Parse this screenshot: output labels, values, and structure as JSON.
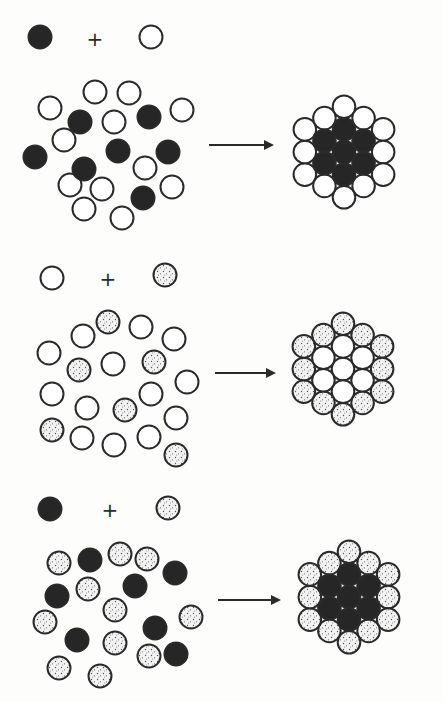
{
  "figure": {
    "colors": {
      "dark_cell": "#262626",
      "light_cell": "#ffffff",
      "dotted_cell": "#f2f2f2",
      "outline": "#2a2a2a",
      "dot": "#555555"
    },
    "cell_radius": 11.5,
    "plus_symbol": "+",
    "panels": [
      {
        "id": "A",
        "legend": {
          "left": {
            "type": "dark",
            "x": 40,
            "y": 37
          },
          "plus": {
            "x": 95,
            "y": 40
          },
          "right": {
            "type": "light",
            "x": 151,
            "y": 37
          }
        },
        "scattered": [
          {
            "type": "light",
            "x": 95,
            "y": 92
          },
          {
            "type": "light",
            "x": 129,
            "y": 93
          },
          {
            "type": "light",
            "x": 50,
            "y": 108
          },
          {
            "type": "light",
            "x": 182,
            "y": 110
          },
          {
            "type": "light",
            "x": 114,
            "y": 122
          },
          {
            "type": "light",
            "x": 64,
            "y": 140
          },
          {
            "type": "light",
            "x": 145,
            "y": 168
          },
          {
            "type": "light",
            "x": 70,
            "y": 185
          },
          {
            "type": "light",
            "x": 102,
            "y": 189
          },
          {
            "type": "light",
            "x": 172,
            "y": 187
          },
          {
            "type": "light",
            "x": 84,
            "y": 209
          },
          {
            "type": "light",
            "x": 122,
            "y": 218
          },
          {
            "type": "dark",
            "x": 80,
            "y": 122
          },
          {
            "type": "dark",
            "x": 149,
            "y": 117
          },
          {
            "type": "dark",
            "x": 35,
            "y": 157
          },
          {
            "type": "dark",
            "x": 118,
            "y": 151
          },
          {
            "type": "dark",
            "x": 168,
            "y": 152
          },
          {
            "type": "dark",
            "x": 84,
            "y": 169
          },
          {
            "type": "dark",
            "x": 143,
            "y": 198
          }
        ],
        "arrow": {
          "x1": 209,
          "x2": 272,
          "y": 145
        },
        "aggregate": {
          "cx": 344,
          "cy": 152,
          "inner": "dark",
          "outer": "light"
        }
      },
      {
        "id": "B",
        "legend": {
          "left": {
            "type": "light",
            "x": 52,
            "y": 278
          },
          "plus": {
            "x": 108,
            "y": 280
          },
          "right": {
            "type": "dotted",
            "x": 165,
            "y": 275
          }
        },
        "scattered": [
          {
            "type": "dotted",
            "x": 108,
            "y": 322
          },
          {
            "type": "dotted",
            "x": 79,
            "y": 370
          },
          {
            "type": "dotted",
            "x": 154,
            "y": 362
          },
          {
            "type": "dotted",
            "x": 125,
            "y": 410
          },
          {
            "type": "dotted",
            "x": 52,
            "y": 430
          },
          {
            "type": "dotted",
            "x": 176,
            "y": 455
          },
          {
            "type": "light",
            "x": 83,
            "y": 336
          },
          {
            "type": "light",
            "x": 141,
            "y": 327
          },
          {
            "type": "light",
            "x": 174,
            "y": 339
          },
          {
            "type": "light",
            "x": 49,
            "y": 353
          },
          {
            "type": "light",
            "x": 113,
            "y": 364
          },
          {
            "type": "light",
            "x": 187,
            "y": 382
          },
          {
            "type": "light",
            "x": 52,
            "y": 394
          },
          {
            "type": "light",
            "x": 87,
            "y": 408
          },
          {
            "type": "light",
            "x": 151,
            "y": 394
          },
          {
            "type": "light",
            "x": 176,
            "y": 418
          },
          {
            "type": "light",
            "x": 82,
            "y": 438
          },
          {
            "type": "light",
            "x": 114,
            "y": 445
          },
          {
            "type": "light",
            "x": 149,
            "y": 437
          }
        ],
        "arrow": {
          "x1": 215,
          "x2": 274,
          "y": 373
        },
        "aggregate": {
          "cx": 343,
          "cy": 369,
          "inner": "light",
          "outer": "dotted"
        }
      },
      {
        "id": "C",
        "legend": {
          "left": {
            "type": "dark",
            "x": 50,
            "y": 509
          },
          "plus": {
            "x": 110,
            "y": 511
          },
          "right": {
            "type": "dotted",
            "x": 168,
            "y": 508
          }
        },
        "scattered": [
          {
            "type": "dotted",
            "x": 59,
            "y": 563
          },
          {
            "type": "dotted",
            "x": 120,
            "y": 554
          },
          {
            "type": "dotted",
            "x": 147,
            "y": 559
          },
          {
            "type": "dotted",
            "x": 88,
            "y": 589
          },
          {
            "type": "dotted",
            "x": 115,
            "y": 610
          },
          {
            "type": "dotted",
            "x": 45,
            "y": 622
          },
          {
            "type": "dotted",
            "x": 191,
            "y": 617
          },
          {
            "type": "dotted",
            "x": 115,
            "y": 643
          },
          {
            "type": "dotted",
            "x": 149,
            "y": 656
          },
          {
            "type": "dotted",
            "x": 59,
            "y": 668
          },
          {
            "type": "dotted",
            "x": 100,
            "y": 676
          },
          {
            "type": "dark",
            "x": 90,
            "y": 560
          },
          {
            "type": "dark",
            "x": 175,
            "y": 573
          },
          {
            "type": "dark",
            "x": 57,
            "y": 596
          },
          {
            "type": "dark",
            "x": 135,
            "y": 586
          },
          {
            "type": "dark",
            "x": 155,
            "y": 628
          },
          {
            "type": "dark",
            "x": 77,
            "y": 640
          },
          {
            "type": "dark",
            "x": 176,
            "y": 654
          }
        ],
        "arrow": {
          "x1": 218,
          "x2": 279,
          "y": 600
        },
        "aggregate": {
          "cx": 349,
          "cy": 597,
          "inner": "dark",
          "outer": "dotted"
        }
      }
    ]
  }
}
